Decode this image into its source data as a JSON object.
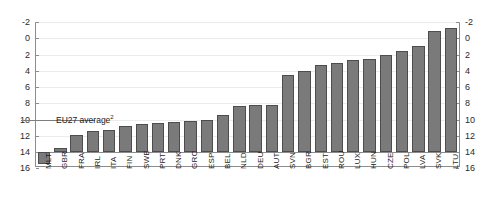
{
  "figure": {
    "top_caption_fragment": "",
    "average_label": "EU27 average",
    "average_footnote": "2",
    "average_value": 4.0
  },
  "chart_data": {
    "type": "bar",
    "title": "",
    "xlabel": "",
    "ylabel": "",
    "ylim": [
      -2,
      16
    ],
    "yticks": [
      -2,
      0,
      2,
      4,
      6,
      8,
      10,
      12,
      14,
      16
    ],
    "ytick_labels_left": [
      "16",
      "14",
      "12",
      "10",
      "8",
      "6",
      "4",
      "2",
      "0",
      "-2"
    ],
    "ytick_labels_right": [
      "16",
      "14",
      "12",
      "10",
      "8",
      "6",
      "4",
      "2",
      "0",
      "-2"
    ],
    "grid": true,
    "legend": "none",
    "bar_color": "#7a7a7a",
    "bar_edge_color": "#4d4d4d",
    "reference_lines": [
      {
        "label": "EU27 average",
        "footnote": "2",
        "value": 4.0
      }
    ],
    "categories": [
      "MLT",
      "GBR",
      "FRA",
      "IRL",
      "ITA",
      "FIN",
      "SWE",
      "PRT",
      "DNK",
      "GRC",
      "ESP",
      "BEL",
      "NLD",
      "DEU",
      "AUT",
      "SVN",
      "BGR",
      "EST",
      "ROU",
      "LUX",
      "HUN",
      "CZE",
      "POL",
      "LVA",
      "SVK",
      "LTU"
    ],
    "values": [
      -1.5,
      0.5,
      2.1,
      2.6,
      2.7,
      3.2,
      3.5,
      3.6,
      3.7,
      3.8,
      4.0,
      4.6,
      5.7,
      5.8,
      5.8,
      9.5,
      10.0,
      10.7,
      10.9,
      11.3,
      11.4,
      11.9,
      12.4,
      13.0,
      14.9,
      15.3
    ]
  }
}
